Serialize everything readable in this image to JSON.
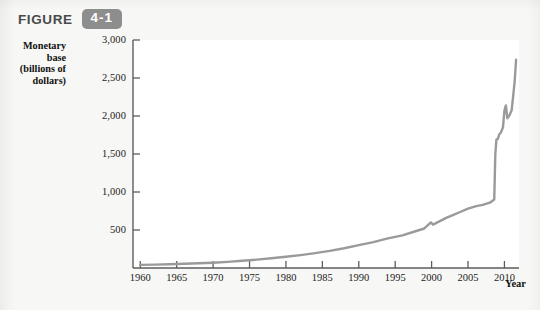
{
  "figure": {
    "label": "FIGURE",
    "number": "4-1",
    "badge_color": "#8d8d8d"
  },
  "axes": {
    "y_title_line1": "Monetary base",
    "y_title_line2": "(billions of",
    "y_title_line3": "dollars)",
    "x_title": "Year"
  },
  "caption_partial": "",
  "chart_data": {
    "type": "line",
    "title": "",
    "xlabel": "Year",
    "ylabel": "Monetary base (billions of dollars)",
    "xlim": [
      1959,
      2012
    ],
    "ylim": [
      0,
      3000
    ],
    "grid": false,
    "legend": "none",
    "line_color": "#9a9a9a",
    "x_ticks": [
      1960,
      1965,
      1970,
      1975,
      1980,
      1985,
      1990,
      1995,
      2000,
      2005,
      2010
    ],
    "x_tick_labels": [
      "1960",
      "1965",
      "1970",
      "1975",
      "1980",
      "1985",
      "1990",
      "1995",
      "2000",
      "2005",
      "2010"
    ],
    "y_ticks": [
      500,
      1000,
      1500,
      2000,
      2500,
      3000
    ],
    "y_tick_labels": [
      "500",
      "1,000",
      "1,500",
      "2,000",
      "2,500",
      "3,000"
    ],
    "series": [
      {
        "name": "Monetary base",
        "x": [
          1960,
          1962,
          1964,
          1966,
          1968,
          1970,
          1972,
          1974,
          1976,
          1978,
          1980,
          1982,
          1984,
          1986,
          1988,
          1990,
          1992,
          1994,
          1996,
          1998,
          1999,
          1999.9,
          2000.2,
          2001,
          2002,
          2003,
          2004,
          2005,
          2006,
          2007,
          2008,
          2008.6,
          2008.75,
          2008.9,
          2009.1,
          2009.3,
          2009.5,
          2009.8,
          2010.0,
          2010.2,
          2010.4,
          2010.7,
          2011.0,
          2011.4,
          2011.6
        ],
        "y": [
          41,
          45,
          50,
          56,
          62,
          70,
          81,
          95,
          110,
          128,
          148,
          170,
          195,
          225,
          260,
          300,
          340,
          390,
          430,
          490,
          520,
          600,
          570,
          610,
          660,
          700,
          740,
          780,
          810,
          830,
          860,
          900,
          1500,
          1690,
          1700,
          1760,
          1780,
          1850,
          2070,
          2140,
          1970,
          2010,
          2080,
          2450,
          2740
        ]
      }
    ],
    "annotations": [
      {
        "text": "Y2K currency bulge near 2000",
        "x": 2000,
        "y": 600
      },
      {
        "text": "2008 financial crisis surge",
        "x": 2008.7,
        "y": 1700
      }
    ]
  }
}
